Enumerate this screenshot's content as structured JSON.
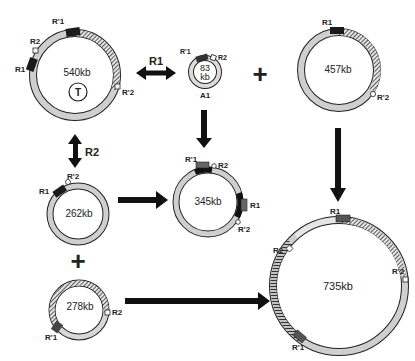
{
  "diagram": {
    "type": "plasmid recombination scheme",
    "colors": {
      "ring_fill": "#cfcfcf",
      "ring_stroke": "#222222",
      "hatch": "#333333",
      "marker_dark": "#1a1a1a",
      "marker_gray": "#555555",
      "arrow": "#111111"
    },
    "plasmids": [
      {
        "id": "p540",
        "size": "540kb",
        "extra": "T",
        "labels": {
          "r1top": "R'1",
          "r2": "R2",
          "r1": "R1",
          "r2p": "R'2"
        }
      },
      {
        "id": "p83",
        "size_line1": "83",
        "size_line2": "kb",
        "name": "A1",
        "labels": {
          "r1p": "R'1",
          "r2": "R2"
        }
      },
      {
        "id": "p457",
        "size": "457kb",
        "labels": {
          "r1": "R1",
          "r2p": "R'2"
        }
      },
      {
        "id": "p262",
        "size": "262kb",
        "labels": {
          "r1": "R1",
          "r2p": "R'2"
        }
      },
      {
        "id": "p345",
        "size": "345kb",
        "labels": {
          "r1p": "R'1",
          "r2": "R2",
          "r1": "R1",
          "r2p": "R'2"
        }
      },
      {
        "id": "p278",
        "size": "278kb",
        "labels": {
          "r2": "R2",
          "r1p": "R'1"
        }
      },
      {
        "id": "p735",
        "size": "735kb",
        "labels": {
          "r1": "R1",
          "r2": "R2",
          "r2p": "R'2",
          "r1p": "R'1"
        }
      }
    ],
    "operators": {
      "arrow_r1_label": "R1",
      "arrow_r2_label": "R2",
      "plus_top": "+",
      "plus_left": "+"
    }
  }
}
